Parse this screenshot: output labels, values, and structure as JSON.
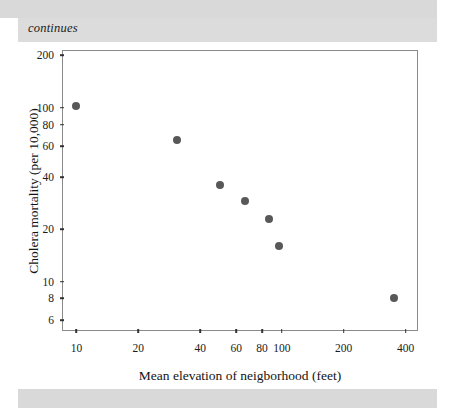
{
  "page": {
    "caption": "continues",
    "band_color": "#d9d9d9",
    "caption_band_color": "#dcdcdc"
  },
  "chart_data": {
    "type": "scatter",
    "title": "",
    "xlabel": "Mean elevation of neigborhood (feet)",
    "ylabel": "Cholera mortality (per 10,000)",
    "xscale": "log",
    "yscale": "log",
    "xlim": [
      8.5,
      460
    ],
    "ylim": [
      5.2,
      215
    ],
    "grid": false,
    "legend": null,
    "marker_color": "#585858",
    "axis_color": "#8a8a8a",
    "xticks": [
      10,
      20,
      40,
      60,
      80,
      100,
      200,
      400
    ],
    "xtick_labels": [
      "10",
      "20",
      "40",
      "60",
      "80",
      "100",
      "200",
      "400"
    ],
    "yticks": [
      6,
      8,
      10,
      20,
      40,
      60,
      80,
      100,
      200
    ],
    "ytick_labels": [
      "6",
      "8",
      "10",
      "20",
      "40",
      "60",
      "80",
      "100",
      "200"
    ],
    "points": [
      {
        "x": 10,
        "y": 102
      },
      {
        "x": 31,
        "y": 65
      },
      {
        "x": 50,
        "y": 36
      },
      {
        "x": 66,
        "y": 29
      },
      {
        "x": 87,
        "y": 23
      },
      {
        "x": 97,
        "y": 16
      },
      {
        "x": 350,
        "y": 8
      }
    ]
  }
}
